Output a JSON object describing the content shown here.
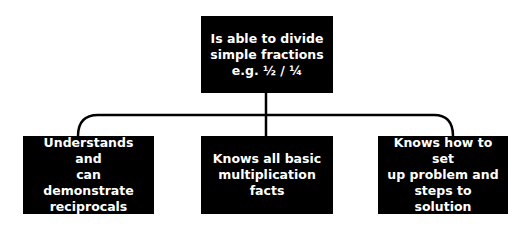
{
  "diagram": {
    "type": "tree",
    "root": {
      "id": "root",
      "text": "Is able to divide\nsimple fractions\ne.g. ½ / ¼"
    },
    "children": [
      {
        "id": "left",
        "text": "Understands and\ncan demonstrate\nreciprocals"
      },
      {
        "id": "mid",
        "text": "Knows all basic\nmultiplication facts"
      },
      {
        "id": "right",
        "text": "Knows how to set\nup problem and\nsteps to solution"
      }
    ],
    "colors": {
      "node_fill": "#000000",
      "node_text": "#ffffff",
      "connector": "#000000",
      "background": "#ffffff"
    }
  }
}
